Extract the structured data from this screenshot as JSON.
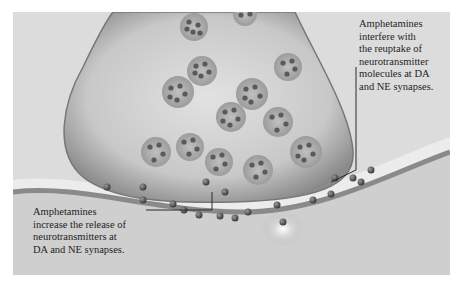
{
  "figure": {
    "annotations": {
      "reuptake": "Amphetamines\ninterfere with\nthe reuptake of\nneurotransmitter\nmolecules at DA\nand NE synapses.",
      "release": "Amphetamines\nincrease the release of\nneurotransmitters at\nDA and NE synapses."
    },
    "colors": {
      "background": "#dcdcdc",
      "terminal_fill": "#c4c4c4",
      "terminal_edge": "#7a7a7a",
      "vesicle": "#a8a8a8",
      "molecule": "#555555",
      "cleft": "#ededed",
      "membrane": "#8e8e8e",
      "leader_line": "#2a2a2a"
    }
  }
}
